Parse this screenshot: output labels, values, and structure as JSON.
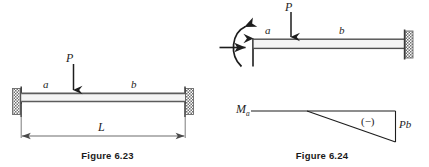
{
  "page": {
    "background": "#ffffff",
    "ink": "#1d1d1d",
    "beam_fill": "#f2f2f2",
    "hatch_color": "#777777",
    "width": 429,
    "height": 167
  },
  "figure_623": {
    "caption": "Figure 6.23",
    "description": "Fixed-fixed beam of length L with concentrated load P at distance a from left support",
    "labels": {
      "load": "P",
      "segment_left": "a",
      "segment_right": "b",
      "span": "L"
    },
    "supports": {
      "left": "fixed-support",
      "right": "fixed-support"
    }
  },
  "figure_624": {
    "caption": "Figure 6.24",
    "description": "Cantilever beam fixed at right end with concentrated load P at distance a from free left end, plus bending moment diagram",
    "labels": {
      "load": "P",
      "segment_left": "a",
      "segment_right": "b"
    },
    "supports": {
      "right": "fixed-support"
    },
    "reactions": {
      "moment": "moment-reaction-arc",
      "horizontal": "horizontal-reaction-arrow",
      "vertical": "vertical-reaction-arrow"
    },
    "moment_diagram": {
      "start_label": "M",
      "start_label_sub": "a",
      "sign_label": "(−)",
      "end_label": "Pb"
    }
  }
}
